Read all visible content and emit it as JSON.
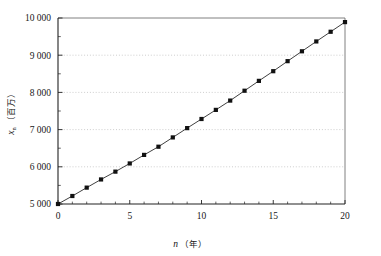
{
  "chart_data": {
    "type": "line",
    "title": "",
    "subtitle": "",
    "xlabel": "n（年）",
    "xlabel_var": "n",
    "xlabel_unit": "（年）",
    "ylabel": "x_n（百万）",
    "ylabel_var": "x",
    "ylabel_sub": "n",
    "ylabel_unit": "（百万）",
    "xlim": [
      0,
      20
    ],
    "ylim": [
      5000,
      10000
    ],
    "xticks": [
      0,
      5,
      10,
      15,
      20
    ],
    "xticklabels": [
      "0",
      "5",
      "10",
      "15",
      "20"
    ],
    "xminorticks": [
      1,
      2,
      3,
      4,
      6,
      7,
      8,
      9,
      11,
      12,
      13,
      14,
      16,
      17,
      18,
      19
    ],
    "yticks": [
      5000,
      6000,
      7000,
      8000,
      9000,
      10000
    ],
    "yticklabels": [
      "5 000",
      "6 000",
      "7 000",
      "8 000",
      "9 000",
      "10 000"
    ],
    "yminorticks": [
      5500,
      6500,
      7500,
      8500,
      9500
    ],
    "grid": "horizontal-dotted",
    "grid_color": "#b9b9b9",
    "legend": "none",
    "marker": "square",
    "marker_color": "#111111",
    "line_color": "#2a2a2a",
    "frame_color": "#5f5f5f",
    "x": [
      0,
      1,
      2,
      3,
      4,
      5,
      6,
      7,
      8,
      9,
      10,
      11,
      12,
      13,
      14,
      15,
      16,
      17,
      18,
      19,
      20
    ],
    "series": [
      {
        "name": "x_n",
        "values": [
          5000,
          5220,
          5448,
          5684,
          5927,
          6179,
          6439,
          6708,
          6986,
          7273,
          7570,
          7878,
          8195,
          8525,
          8865,
          9217,
          9582,
          9957,
          10000,
          10000,
          10000
        ]
      }
    ],
    "values": [
      5000,
      5220,
      5448,
      5684,
      5927,
      6179,
      6439,
      6708,
      6986,
      7273,
      7570,
      7878,
      8195,
      8525,
      8865,
      9217,
      9582,
      9959,
      10000,
      10000,
      10000
    ]
  },
  "figure": {
    "background": "#ffffff",
    "points": [
      {
        "n": 0,
        "v": 5000
      },
      {
        "n": 1,
        "v": 5215
      },
      {
        "n": 2,
        "v": 5440
      },
      {
        "n": 3,
        "v": 5660
      },
      {
        "n": 4,
        "v": 5870
      },
      {
        "n": 5,
        "v": 6090
      },
      {
        "n": 6,
        "v": 6320
      },
      {
        "n": 7,
        "v": 6540
      },
      {
        "n": 8,
        "v": 6790
      },
      {
        "n": 9,
        "v": 7040
      },
      {
        "n": 10,
        "v": 7285
      },
      {
        "n": 11,
        "v": 7530
      },
      {
        "n": 12,
        "v": 7780
      },
      {
        "n": 13,
        "v": 8045
      },
      {
        "n": 14,
        "v": 8310
      },
      {
        "n": 15,
        "v": 8570
      },
      {
        "n": 16,
        "v": 8840
      },
      {
        "n": 17,
        "v": 9105
      },
      {
        "n": 18,
        "v": 9370
      },
      {
        "n": 19,
        "v": 9630
      },
      {
        "n": 20,
        "v": 9890
      }
    ]
  }
}
